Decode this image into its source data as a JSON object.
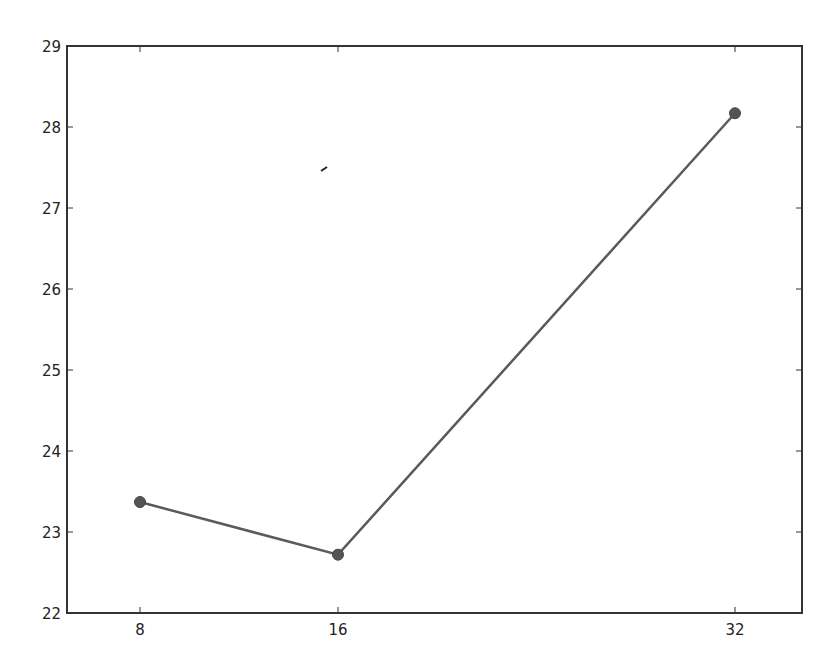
{
  "chart_data": {
    "type": "line",
    "title": "",
    "xlabel": "",
    "ylabel": "",
    "x": [
      8,
      16,
      32
    ],
    "series": [
      {
        "name": "series-1",
        "values": [
          23.37,
          22.72,
          28.17
        ],
        "color": "#5a5a5a",
        "marker": "circle"
      }
    ],
    "xticks": [
      "8",
      "16",
      "32"
    ],
    "xtick_values": [
      8,
      16,
      32
    ],
    "yticks": [
      "22",
      "23",
      "24",
      "25",
      "26",
      "27",
      "28",
      "29"
    ],
    "ytick_values": [
      22,
      23,
      24,
      25,
      26,
      27,
      28,
      29
    ],
    "xlim": [
      4.3,
      37.3
    ],
    "ylim": [
      22,
      29
    ],
    "grid": false,
    "legend": null
  },
  "layout": {
    "plot": {
      "left": 67,
      "top": 46,
      "right": 802,
      "bottom": 613
    },
    "x_pixel": {
      "8": 140,
      "16": 338,
      "32": 735
    },
    "axis_color": "#333333",
    "line_color": "#5a5a5a",
    "marker_color": "#555555"
  }
}
